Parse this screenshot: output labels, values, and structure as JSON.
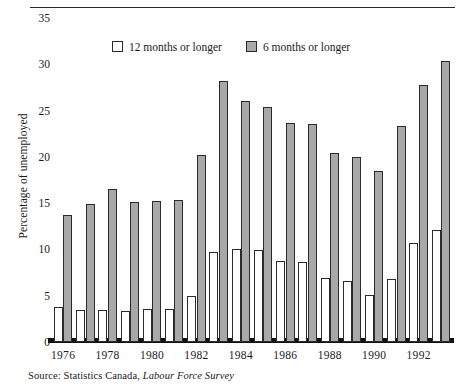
{
  "figure": {
    "top_caption": "",
    "ylabel": "Percentage of unemployed",
    "source_prefix": "Source: Statistics Canada,",
    "source_italic": "Labour Force Survey"
  },
  "legend": {
    "position": "top-center",
    "items": [
      {
        "label": "12 months or longer",
        "swatch": "white-square-icon",
        "color": "#ffffff"
      },
      {
        "label": "6 months or longer",
        "swatch": "grey-square-icon",
        "color": "#a8a8a8"
      }
    ]
  },
  "colors": {
    "series_white": "#ffffff",
    "series_grey": "#a8a8a8",
    "outline": "#2b2b2b",
    "axis": "#111111",
    "text": "#1a1a1a"
  },
  "chart_data": {
    "type": "bar",
    "title": "",
    "subtitle": "",
    "xlabel": "",
    "ylabel": "Percentage of unemployed",
    "ylim": [
      0,
      35
    ],
    "yticks": [
      0,
      5,
      10,
      15,
      20,
      25,
      30,
      35
    ],
    "ytick_labels": [
      "0",
      "5",
      "10",
      "15",
      "20",
      "25",
      "30",
      "35"
    ],
    "grid": false,
    "legend_position": "top-center",
    "categories": [
      "1976",
      "1977",
      "1978",
      "1979",
      "1980",
      "1981",
      "1982",
      "1983",
      "1984",
      "1985",
      "1986",
      "1987",
      "1988",
      "1989",
      "1990",
      "1991",
      "1992",
      "1993"
    ],
    "xtick_labels_shown": [
      "1976",
      "1978",
      "1980",
      "1982",
      "1984",
      "1986",
      "1988",
      "1990",
      "1992"
    ],
    "series": [
      {
        "name": "12 months or longer",
        "color": "#ffffff",
        "values": [
          3.8,
          3.5,
          3.5,
          3.4,
          3.6,
          3.6,
          5.0,
          9.7,
          10.0,
          9.9,
          8.7,
          8.6,
          6.9,
          6.6,
          5.1,
          6.8,
          10.7,
          12.1
        ]
      },
      {
        "name": "6 months or longer",
        "color": "#a8a8a8",
        "values": [
          13.7,
          14.9,
          16.5,
          15.1,
          15.2,
          15.3,
          20.2,
          28.2,
          26.0,
          25.4,
          23.7,
          23.6,
          20.4,
          20.0,
          18.5,
          23.3,
          27.8,
          30.4
        ]
      }
    ]
  }
}
